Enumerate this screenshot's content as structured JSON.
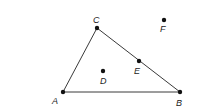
{
  "diagram": {
    "type": "geometry",
    "points": [
      {
        "id": "A",
        "label": "A",
        "x": 63,
        "y": 92,
        "lx": 55,
        "ly": 102
      },
      {
        "id": "B",
        "label": "B",
        "x": 180,
        "y": 92,
        "lx": 177,
        "ly": 104
      },
      {
        "id": "C",
        "label": "C",
        "x": 97,
        "y": 28,
        "lx": 94,
        "ly": 22
      },
      {
        "id": "D",
        "label": "D",
        "x": 103,
        "y": 71,
        "lx": 100,
        "ly": 82
      },
      {
        "id": "E",
        "label": "E",
        "x": 139,
        "y": 61,
        "lx": 135,
        "ly": 72
      },
      {
        "id": "F",
        "label": "F",
        "x": 164,
        "y": 20,
        "lx": 160,
        "ly": 31
      }
    ],
    "segments": [
      {
        "from": "A",
        "to": "C"
      },
      {
        "from": "C",
        "to": "B"
      },
      {
        "from": "A",
        "to": "B"
      }
    ],
    "colors": {
      "line": "#3a3a3a",
      "point": "#111111",
      "label": "#222222"
    }
  }
}
